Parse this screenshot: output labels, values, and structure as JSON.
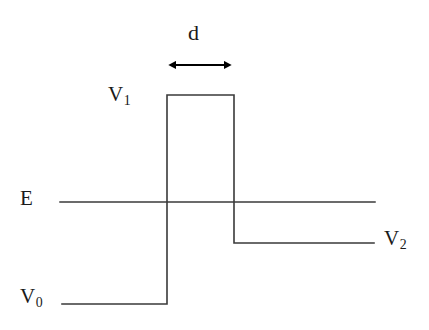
{
  "figure": {
    "kind": "potential-energy-step-barrier-diagram",
    "background_color": "#ffffff",
    "line_color": "#3a3a3a",
    "arrow_color": "#000000",
    "text_color": "#1a1a1a",
    "width": 429,
    "height": 330
  },
  "labels": {
    "width_label": "d",
    "barrier_top_label_base": "V",
    "barrier_top_label_sub": "1",
    "energy_label": "E",
    "right_level_label_base": "V",
    "right_level_label_sub": "2",
    "left_level_label_base": "V",
    "left_level_label_sub": "0"
  },
  "chart_data": {
    "type": "line",
    "title": "",
    "xlabel": "",
    "ylabel": "",
    "grid": false,
    "legend": null,
    "axis_pixel_ranges": {
      "x": [
        0,
        429
      ],
      "y": [
        0,
        330
      ]
    },
    "levels": [
      {
        "name": "V0",
        "label": "V",
        "subscript": "0",
        "y_pixel": 304,
        "x_start_pixel": 62,
        "x_end_pixel": 167,
        "relative_height": 0.0
      },
      {
        "name": "V1",
        "label": "V",
        "subscript": "1",
        "y_pixel": 95,
        "x_start_pixel": 167,
        "x_end_pixel": 234,
        "relative_height": 1.0
      },
      {
        "name": "V2",
        "label": "V",
        "subscript": "2",
        "y_pixel": 243,
        "x_start_pixel": 234,
        "x_end_pixel": 374,
        "relative_height": 0.29
      }
    ],
    "energy_line": {
      "name": "E",
      "label": "E",
      "y_pixel": 202,
      "x_start_pixel": 60,
      "x_end_pixel": 375,
      "relative_height": 0.49
    },
    "barrier_width_marker": {
      "label": "d",
      "y_pixel": 65,
      "x_start_pixel": 168,
      "x_end_pixel": 232,
      "width_pixels": 64,
      "style": "double-headed-arrow"
    },
    "potential_path_points": [
      [
        62,
        304
      ],
      [
        167,
        304
      ],
      [
        167,
        95
      ],
      [
        234,
        95
      ],
      [
        234,
        243
      ],
      [
        374,
        243
      ]
    ]
  }
}
